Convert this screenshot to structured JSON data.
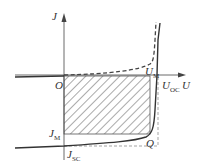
{
  "diagram": {
    "type": "solar-cell-JU-characteristic",
    "axes": {
      "y_label": "J",
      "x_label": "U",
      "origin_label": "O"
    },
    "points": {
      "open_circuit_voltage": {
        "main": "U",
        "sub": "OC"
      },
      "max_power_voltage": {
        "main": "U",
        "sub": "M"
      },
      "max_power_current": {
        "main": "J",
        "sub": "M"
      },
      "short_circuit_current": {
        "main": "J",
        "sub": "SC"
      },
      "max_power_point": "Q"
    },
    "curves": [
      {
        "name": "dark-curve",
        "style": "dashed"
      },
      {
        "name": "illuminated-curve",
        "style": "solid"
      }
    ],
    "regions": [
      {
        "name": "max-power-rectangle",
        "style": "hatched"
      }
    ],
    "colors": {
      "line": "#333333",
      "dashed": "#444444",
      "guide": "#999999"
    }
  }
}
